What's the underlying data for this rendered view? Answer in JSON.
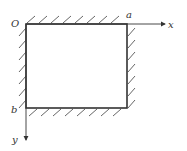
{
  "diagram": {
    "labels": {
      "origin": "O",
      "corner_a": "a",
      "corner_b": "b",
      "x_axis": "x",
      "y_axis": "y"
    },
    "colors": {
      "stroke": "#333333",
      "hatch": "#555555",
      "background": "#ffffff"
    },
    "constrained_edges": [
      "top",
      "right",
      "bottom",
      "left"
    ]
  }
}
